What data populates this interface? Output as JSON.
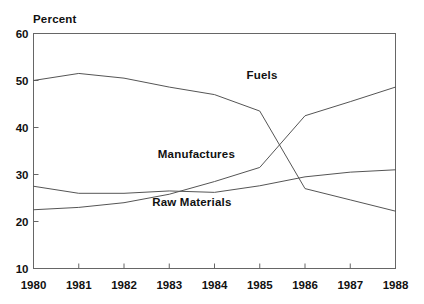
{
  "chart_data": {
    "type": "line",
    "title": "",
    "subtitle": "",
    "xlabel": "",
    "ylabel": "Percent",
    "x": [
      1980,
      1981,
      1982,
      1983,
      1984,
      1985,
      1986,
      1987,
      1988
    ],
    "categories": [
      "1980",
      "1981",
      "1982",
      "1983",
      "1984",
      "1985",
      "1986",
      "1987",
      "1988"
    ],
    "xlim": [
      1980,
      1988
    ],
    "ylim": [
      10,
      60
    ],
    "yticks": [
      10,
      20,
      30,
      40,
      50,
      60
    ],
    "ytick_labels": [
      "10",
      "20",
      "30",
      "40",
      "50",
      "60"
    ],
    "xticks": [
      1980,
      1981,
      1982,
      1983,
      1984,
      1985,
      1986,
      1987,
      1988
    ],
    "xtick_labels": [
      "1980",
      "1981",
      "1982",
      "1983",
      "1984",
      "1985",
      "1986",
      "1987",
      "1988"
    ],
    "grid": false,
    "legend_position": "inline-annotations",
    "line_color": "#555555",
    "axis_color": "#666666",
    "background": "#ffffff",
    "series": [
      {
        "name": "Fuels",
        "label": "Fuels",
        "label_x": 1985.05,
        "label_y": 51.0,
        "values": [
          50.0,
          51.5,
          50.5,
          48.6,
          47.0,
          43.5,
          27.0,
          24.6,
          22.2
        ]
      },
      {
        "name": "Manufactures",
        "label": "Manufactures",
        "label_x": 1983.6,
        "label_y": 34.2,
        "values": [
          22.5,
          23.0,
          24.0,
          25.8,
          28.5,
          31.5,
          42.5,
          45.5,
          48.6
        ]
      },
      {
        "name": "Raw Materials",
        "label": "Raw Materials",
        "label_x": 1983.5,
        "label_y": 24.0,
        "values": [
          27.5,
          26.0,
          26.0,
          26.5,
          26.2,
          27.6,
          29.5,
          30.5,
          31.0
        ]
      }
    ]
  }
}
